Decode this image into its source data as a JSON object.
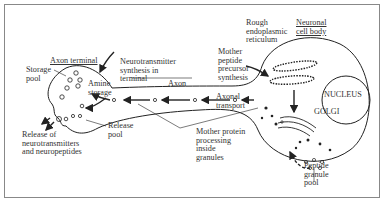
{
  "diagram": {
    "labels": {
      "axon_terminal": "Axon terminal",
      "storage_pool": "Storage\npool",
      "neurotransmitter_synthesis": "Neurotransmitter\nsynthesis in\nterminal",
      "amine_storage": "Amine\nstorage",
      "axon": "Axon",
      "release_pool": "Release\npool",
      "release_of": "Release of\nneurotransmitters\nand neuropeptides",
      "rough_er": "Rough\nendoplasmic\nreticulum",
      "neuronal_cell_body": "Neuronal\ncell body",
      "mother_peptide": "Mother\npeptide\nprecursor\nsynthesis",
      "nucleus": "NUCLEUS",
      "axonal_transport": "Axonal\ntransport",
      "golgi": "GOLGI",
      "mother_protein": "Mother protein\nprocessing\ninside\ngranules",
      "peptide_granule_pool": "Peptide\ngranule\npool"
    },
    "colors": {
      "stroke": "#222222",
      "frame": "#888888",
      "background": "#ffffff"
    }
  }
}
